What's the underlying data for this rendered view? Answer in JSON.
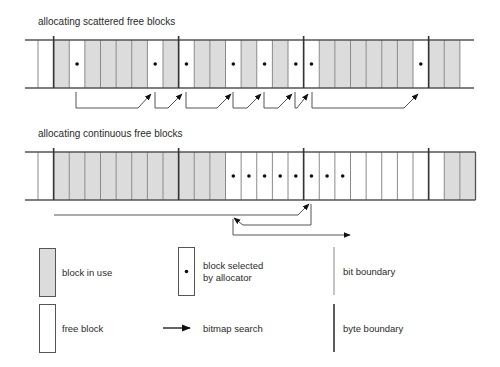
{
  "colors": {
    "in_use": "#dcdcdc",
    "free": "#ffffff",
    "line": "#555555",
    "bit_line": "#8a8a8a",
    "byte_line": "#333333",
    "dot": "#111111",
    "arrow": "#555555"
  },
  "layout": {
    "cell_start_x": 38,
    "cell_width": 15.625,
    "rail_left_x": 25,
    "rail_right_x": 474
  },
  "rows": [
    {
      "title": "allocating scattered free blocks",
      "title_y": 25,
      "top_y": 40,
      "bottom_y": 88,
      "closed_right": false,
      "byte_boundaries": [
        1,
        9,
        17,
        25
      ],
      "cells": [
        {
          "state": "free",
          "selected": false
        },
        {
          "state": "used",
          "selected": false
        },
        {
          "state": "free",
          "selected": true
        },
        {
          "state": "used",
          "selected": false
        },
        {
          "state": "used",
          "selected": false
        },
        {
          "state": "used",
          "selected": false
        },
        {
          "state": "used",
          "selected": false
        },
        {
          "state": "free",
          "selected": true
        },
        {
          "state": "used",
          "selected": false
        },
        {
          "state": "free",
          "selected": true
        },
        {
          "state": "used",
          "selected": false
        },
        {
          "state": "used",
          "selected": false
        },
        {
          "state": "free",
          "selected": true
        },
        {
          "state": "used",
          "selected": false
        },
        {
          "state": "free",
          "selected": true
        },
        {
          "state": "used",
          "selected": false
        },
        {
          "state": "free",
          "selected": true
        },
        {
          "state": "free",
          "selected": true
        },
        {
          "state": "used",
          "selected": false
        },
        {
          "state": "used",
          "selected": false
        },
        {
          "state": "used",
          "selected": false
        },
        {
          "state": "used",
          "selected": false
        },
        {
          "state": "used",
          "selected": false
        },
        {
          "state": "used",
          "selected": false
        },
        {
          "state": "free",
          "selected": true
        },
        {
          "state": "used",
          "selected": false
        },
        {
          "state": "used",
          "selected": false
        }
      ],
      "arrows": [
        {
          "points": [
            [
              76,
              92
            ],
            [
              76,
              108
            ],
            [
              138,
              108
            ],
            [
              151,
              94
            ]
          ]
        },
        {
          "points": [
            [
              155,
              92
            ],
            [
              155,
              108
            ],
            [
              168,
              108
            ],
            [
              182,
              94
            ]
          ]
        },
        {
          "points": [
            [
              186,
              92
            ],
            [
              186,
              108
            ],
            [
              217,
              108
            ],
            [
              231,
              94
            ]
          ]
        },
        {
          "points": [
            [
              233,
              92
            ],
            [
              233,
              108
            ],
            [
              247,
              108
            ],
            [
              261,
              94
            ]
          ]
        },
        {
          "points": [
            [
              264,
              92
            ],
            [
              264,
              108
            ],
            [
              278,
              108
            ],
            [
              292,
              94
            ]
          ]
        },
        {
          "points": [
            [
              295,
              92
            ],
            [
              295,
              108
            ],
            [
              297,
              108
            ],
            [
              308,
              94
            ]
          ]
        },
        {
          "points": [
            [
              312,
              92
            ],
            [
              312,
              108
            ],
            [
              404,
              108
            ],
            [
              418,
              94
            ]
          ]
        }
      ]
    },
    {
      "title": "allocating continuous free blocks",
      "title_y": 137,
      "top_y": 152,
      "bottom_y": 200,
      "closed_right": true,
      "byte_boundaries": [
        1,
        9,
        17,
        25
      ],
      "cells": [
        {
          "state": "free",
          "selected": false
        },
        {
          "state": "used",
          "selected": false
        },
        {
          "state": "used",
          "selected": false
        },
        {
          "state": "used",
          "selected": false
        },
        {
          "state": "used",
          "selected": false
        },
        {
          "state": "used",
          "selected": false
        },
        {
          "state": "used",
          "selected": false
        },
        {
          "state": "used",
          "selected": false
        },
        {
          "state": "used",
          "selected": false
        },
        {
          "state": "used",
          "selected": false
        },
        {
          "state": "used",
          "selected": false
        },
        {
          "state": "used",
          "selected": false
        },
        {
          "state": "free",
          "selected": true
        },
        {
          "state": "free",
          "selected": true
        },
        {
          "state": "free",
          "selected": true
        },
        {
          "state": "free",
          "selected": true
        },
        {
          "state": "free",
          "selected": true
        },
        {
          "state": "free",
          "selected": true
        },
        {
          "state": "free",
          "selected": true
        },
        {
          "state": "free",
          "selected": true
        },
        {
          "state": "free",
          "selected": false
        },
        {
          "state": "free",
          "selected": false
        },
        {
          "state": "free",
          "selected": false
        },
        {
          "state": "free",
          "selected": false
        },
        {
          "state": "free",
          "selected": false
        },
        {
          "state": "free",
          "selected": false
        },
        {
          "state": "used",
          "selected": false
        },
        {
          "state": "used",
          "selected": false
        }
      ],
      "arrows": [
        {
          "points": [
            [
              54,
              215
            ],
            [
              298,
              215
            ],
            [
              309,
              204
            ]
          ]
        },
        {
          "points": [
            [
              311,
              204
            ],
            [
              311,
              225
            ],
            [
              243,
              225
            ],
            [
              234,
              218
            ]
          ]
        },
        {
          "points": [
            [
              233,
              219
            ],
            [
              233,
              235
            ],
            [
              350,
              235
            ]
          ]
        }
      ]
    }
  ],
  "legend": [
    {
      "kind": "used-box",
      "label_lines": [
        "block in use"
      ],
      "x": 39,
      "y": 248
    },
    {
      "kind": "selected-box",
      "label_lines": [
        "block selected",
        "by allocator"
      ],
      "x": 178,
      "y": 247
    },
    {
      "kind": "bit-line",
      "label_lines": [
        "bit boundary"
      ],
      "x": 334,
      "y": 247
    },
    {
      "kind": "free-box",
      "label_lines": [
        "free block"
      ],
      "x": 39,
      "y": 304
    },
    {
      "kind": "arrow",
      "label_lines": [
        "bitmap search"
      ],
      "x": 163,
      "y": 304
    },
    {
      "kind": "byte-line",
      "label_lines": [
        "byte boundary"
      ],
      "x": 334,
      "y": 304
    }
  ]
}
